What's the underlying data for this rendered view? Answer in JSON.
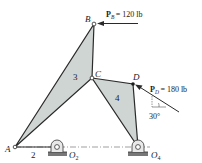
{
  "diagram": {
    "colors": {
      "link_fill": "#cfd5d3",
      "line": "#2a2a2a",
      "ground_hatch": "#555555",
      "background": "#ffffff"
    },
    "points": {
      "A": "A",
      "B": "B",
      "C": "C",
      "D": "D",
      "O2": "O",
      "O2_sub": "2",
      "O4": "O",
      "O4_sub": "4"
    },
    "links": {
      "link2": "2",
      "link3": "3",
      "link4": "4"
    },
    "forces": {
      "PB": {
        "symbol": "P",
        "sub": "B",
        "value": "= 120 lb"
      },
      "PD": {
        "symbol": "P",
        "sub": "D",
        "value": "= 180 lb"
      }
    },
    "angle": {
      "value": "30°"
    }
  }
}
